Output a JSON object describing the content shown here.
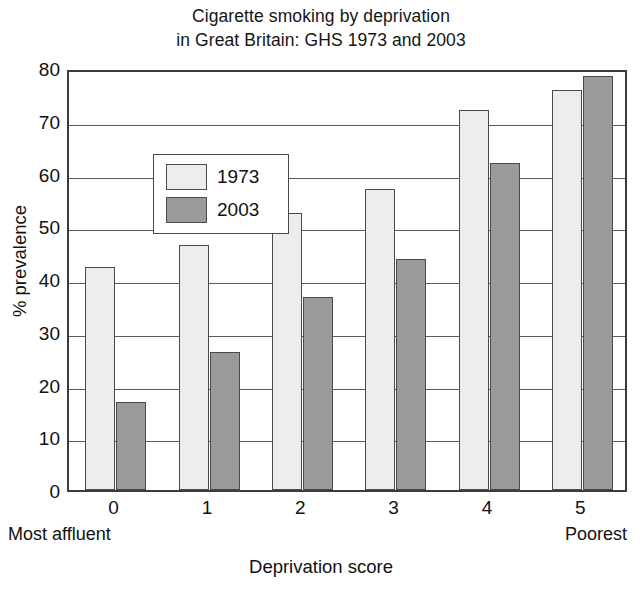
{
  "chart_data": {
    "type": "bar",
    "title": "Cigarette smoking by deprivation in Great Britain: GHS 1973 and 2003",
    "title_lines": [
      "Cigarette smoking by deprivation",
      "in Great Britain: GHS 1973 and 2003"
    ],
    "xlabel": "Deprivation score",
    "ylabel": "% prevalence",
    "categories": [
      "0",
      "1",
      "2",
      "3",
      "4",
      "5"
    ],
    "x_axis_endpoint_labels": {
      "left": "Most affluent",
      "right": "Poorest"
    },
    "series": [
      {
        "name": "1973",
        "color": "#ededed",
        "values": [
          42.2,
          46.4,
          52.6,
          57.1,
          72.0,
          75.9
        ]
      },
      {
        "name": "2003",
        "color": "#9a9a9a",
        "values": [
          16.6,
          26.2,
          36.6,
          43.7,
          62.0,
          78.4
        ]
      }
    ],
    "ylim": [
      0,
      80
    ],
    "y_ticks": [
      0,
      10,
      20,
      30,
      40,
      50,
      60,
      70,
      80
    ],
    "y_tick_labels": [
      "0",
      "10",
      "20",
      "30",
      "40",
      "50",
      "60",
      "70",
      "80"
    ],
    "grid": true,
    "grid_axis": "y",
    "legend_position": "upper left",
    "legend_entries": [
      "1973",
      "2003"
    ],
    "bar_border_color": "#4a4a4a",
    "axis_color": "#3c3c3c",
    "background": "#ffffff"
  }
}
